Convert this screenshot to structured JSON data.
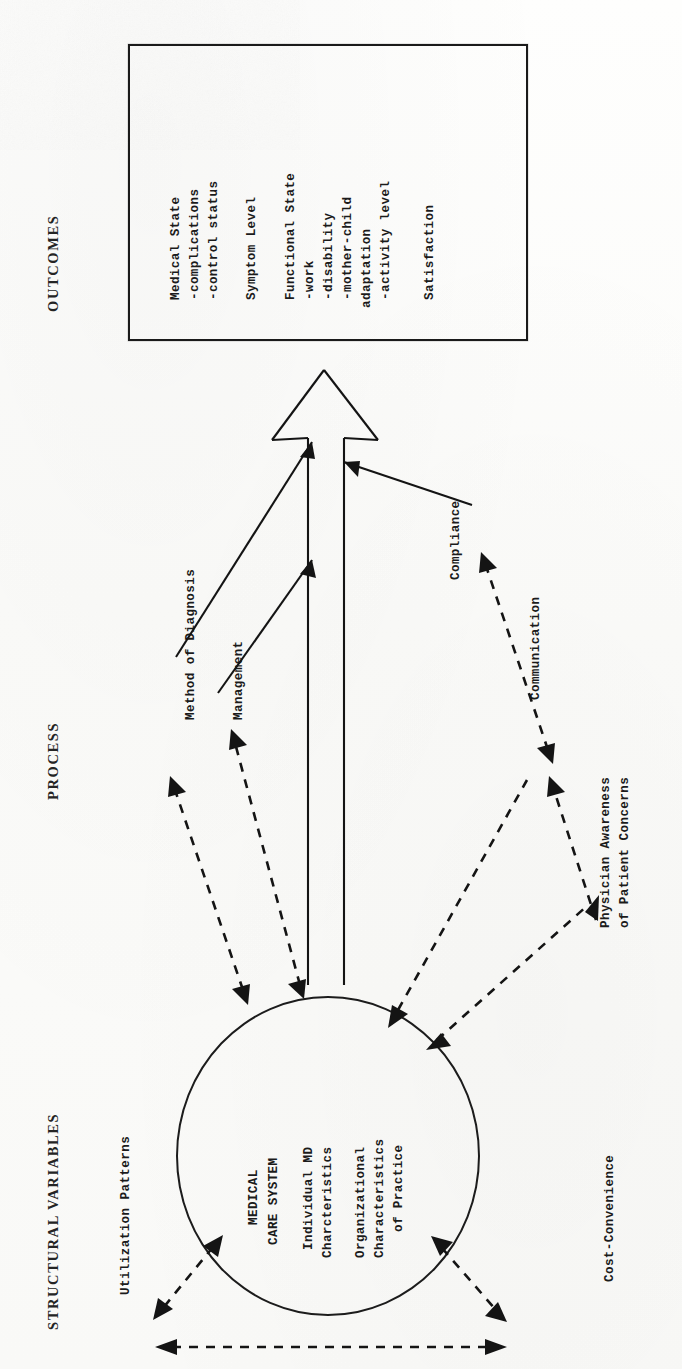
{
  "figure": {
    "type": "conceptual-model-diagram",
    "orientation": "rotated-90-ccw",
    "columns": [
      {
        "id": "structural",
        "label": "STRUCTURAL VARIABLES"
      },
      {
        "id": "process",
        "label": "PROCESS"
      },
      {
        "id": "outcomes",
        "label": "OUTCOMES"
      }
    ]
  },
  "headings": {
    "outcomes": "OUTCOMES",
    "process": "PROCESS",
    "structural": "STRUCTURAL VARIABLES"
  },
  "outcomes_box": {
    "groups": [
      {
        "title": "Medical State",
        "items": [
          "-complications",
          "-control status"
        ]
      },
      {
        "title": "Symptom Level",
        "items": []
      },
      {
        "title": "Functional State",
        "items": [
          "-work",
          "-disability",
          "-mother-child",
          "adaptation",
          "-activity level"
        ]
      },
      {
        "title": "Satisfaction",
        "items": []
      }
    ]
  },
  "circle": {
    "lines": [
      "MEDICAL",
      "CARE SYSTEM",
      "Individual MD",
      "Charcteristics",
      "Organizational",
      "Characteristics",
      "of Practice"
    ],
    "title_lines": [
      "MEDICAL",
      "CARE SYSTEM"
    ],
    "block_md": [
      "Individual MD",
      "Charcteristics"
    ],
    "block_org": [
      "Organizational",
      "Characteristics",
      "of Practice"
    ]
  },
  "process_labels": [
    {
      "id": "method-of-diagnosis",
      "text": "Method of Diagnosis"
    },
    {
      "id": "management",
      "text": "Management"
    },
    {
      "id": "compliance",
      "text": "Compliance"
    },
    {
      "id": "communication",
      "text": "Communication"
    },
    {
      "id": "physician-awareness",
      "line1": "Physician Awareness",
      "line2": "of Patient Concerns"
    }
  ],
  "structural_labels": [
    {
      "id": "utilization-patterns",
      "text": "Utilization Patterns"
    },
    {
      "id": "cost-convenience",
      "text": "Cost-Convenience"
    }
  ],
  "colors": {
    "ink": "#141414",
    "paper": "#fbfbf9"
  }
}
